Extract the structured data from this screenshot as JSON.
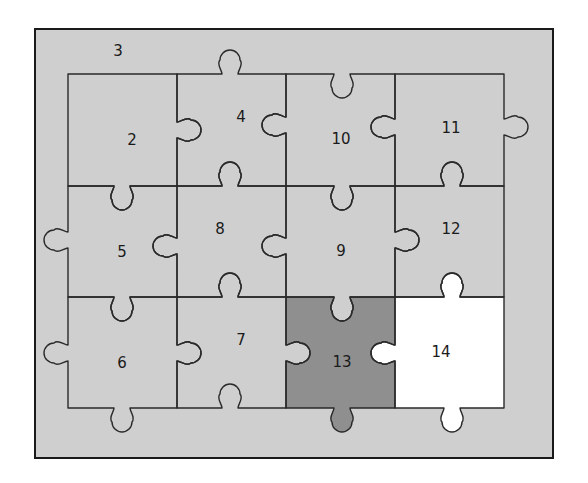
{
  "diagram": {
    "title": "",
    "colors": {
      "background": "#ffffff",
      "frame_fill": "#cfcfcf",
      "frame_stroke": "#1a1a1a",
      "piece_fill": "#cfcfcf",
      "highlight_dark": "#8f8f8f",
      "highlight_white": "#ffffff",
      "line": "#2a2a2a"
    },
    "frame": {
      "label": "3",
      "label_x": 118,
      "label_y": 51
    },
    "grid": {
      "cols_x": [
        68,
        177,
        286,
        395,
        504
      ],
      "rows_y": [
        74,
        186,
        297,
        408
      ]
    },
    "pieces": [
      {
        "id": "2",
        "row": 0,
        "col": 0,
        "label": "2",
        "label_x": 132,
        "label_y": 140,
        "fill": "piece"
      },
      {
        "id": "4",
        "row": 0,
        "col": 1,
        "label": "4",
        "label_x": 241,
        "label_y": 117,
        "fill": "piece"
      },
      {
        "id": "10",
        "row": 0,
        "col": 2,
        "label": "10",
        "label_x": 341,
        "label_y": 139,
        "fill": "piece"
      },
      {
        "id": "11",
        "row": 0,
        "col": 3,
        "label": "11",
        "label_x": 451,
        "label_y": 128,
        "fill": "piece"
      },
      {
        "id": "5",
        "row": 1,
        "col": 0,
        "label": "5",
        "label_x": 122,
        "label_y": 252,
        "fill": "piece"
      },
      {
        "id": "8",
        "row": 1,
        "col": 1,
        "label": "8",
        "label_x": 220,
        "label_y": 229,
        "fill": "piece"
      },
      {
        "id": "9",
        "row": 1,
        "col": 2,
        "label": "9",
        "label_x": 341,
        "label_y": 251,
        "fill": "piece"
      },
      {
        "id": "12",
        "row": 1,
        "col": 3,
        "label": "12",
        "label_x": 451,
        "label_y": 229,
        "fill": "piece"
      },
      {
        "id": "6",
        "row": 2,
        "col": 0,
        "label": "6",
        "label_x": 122,
        "label_y": 363,
        "fill": "piece"
      },
      {
        "id": "7",
        "row": 2,
        "col": 1,
        "label": "7",
        "label_x": 241,
        "label_y": 340,
        "fill": "piece"
      },
      {
        "id": "13",
        "row": 2,
        "col": 2,
        "label": "13",
        "label_x": 342,
        "label_y": 362,
        "fill": "dark"
      },
      {
        "id": "14",
        "row": 2,
        "col": 3,
        "label": "14",
        "label_x": 441,
        "label_y": 352,
        "fill": "white"
      }
    ],
    "edges_note": "h_edges[r][c]: horizontal edge at rows_y[r] over column c; v_edges[r][c]: vertical edge at cols_x[c] for row r. Value = signed tab direction (+1 = knob toward +y / +x, -1 = knob toward -y / -x, 0 = flat). pos = tab center along edge.",
    "h_edges": [
      [
        {
          "d": 0,
          "pos": 122
        },
        {
          "d": -1,
          "pos": 230
        },
        {
          "d": 1,
          "pos": 342
        },
        {
          "d": 0,
          "pos": 452
        }
      ],
      [
        {
          "d": 1,
          "pos": 122
        },
        {
          "d": -1,
          "pos": 230
        },
        {
          "d": 1,
          "pos": 342
        },
        {
          "d": -1,
          "pos": 452
        }
      ],
      [
        {
          "d": 1,
          "pos": 122
        },
        {
          "d": -1,
          "pos": 230
        },
        {
          "d": 1,
          "pos": 342
        },
        {
          "d": -1,
          "pos": 452
        }
      ],
      [
        {
          "d": 1,
          "pos": 122
        },
        {
          "d": -1,
          "pos": 230
        },
        {
          "d": 1,
          "pos": 342
        },
        {
          "d": 1,
          "pos": 452
        }
      ]
    ],
    "v_edges": [
      [
        {
          "d": 0,
          "pos": 130
        },
        {
          "d": 1,
          "pos": 130
        },
        {
          "d": -1,
          "pos": 125
        },
        {
          "d": -1,
          "pos": 127
        },
        {
          "d": 1,
          "pos": 127
        }
      ],
      [
        {
          "d": -1,
          "pos": 240
        },
        {
          "d": -1,
          "pos": 246
        },
        {
          "d": -1,
          "pos": 246
        },
        {
          "d": 1,
          "pos": 240
        },
        {
          "d": 0,
          "pos": 240
        }
      ],
      [
        {
          "d": -1,
          "pos": 353
        },
        {
          "d": 1,
          "pos": 353
        },
        {
          "d": 1,
          "pos": 353
        },
        {
          "d": -1,
          "pos": 353
        },
        {
          "d": 0,
          "pos": 353
        }
      ]
    ]
  }
}
